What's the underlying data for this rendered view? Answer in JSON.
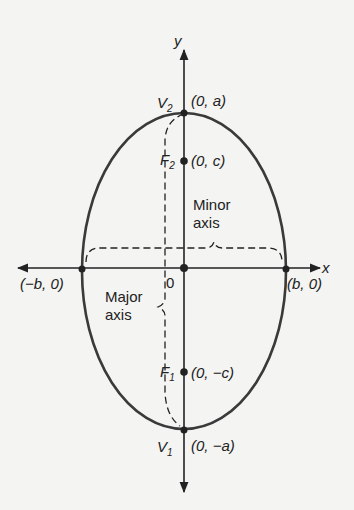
{
  "colors": {
    "background": "#f4f4f2",
    "ink": "#222222",
    "curve": "#3a3a3a"
  },
  "axes": {
    "x_label": "x",
    "y_label": "y",
    "origin_label": "0"
  },
  "points": {
    "v2": {
      "name": "V",
      "sub": "2",
      "coord": "(0, a)"
    },
    "f2": {
      "name": "F",
      "sub": "2",
      "coord": "(0, c)"
    },
    "f1": {
      "name": "F",
      "sub": "1",
      "coord": "(0, −c)"
    },
    "v1": {
      "name": "V",
      "sub": "1",
      "coord": "(0, −a)"
    },
    "left": {
      "coord": "(−b, 0)"
    },
    "right": {
      "coord": "(b, 0)"
    }
  },
  "annotations": {
    "minor_axis_line1": "Minor",
    "minor_axis_line2": "axis",
    "major_axis_line1": "Major",
    "major_axis_line2": "axis"
  }
}
